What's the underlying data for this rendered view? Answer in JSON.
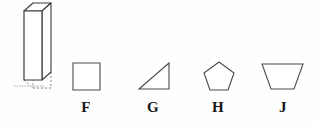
{
  "figure": {
    "background_color": "#fefefe",
    "stroke_color": "#3d3d3d",
    "fill_color": "#ffffff",
    "label_color": "#151515",
    "prism": {
      "name": "rectangular-prism",
      "description": "tall vertical rectangular prism drawn in oblique projection with dashed hidden bottom edge",
      "front_face": "24,11 24,80 42,80 42,11",
      "top_face": "24,11 33,3 51,3 42,11",
      "side_face": "42,11 51,3 51,72 42,80",
      "hidden_edge_vertical": "33,11 33,80",
      "hidden_edge_bottom": "24,80 33,88 51,88 42,80",
      "hidden_dash": "14,86 44,86"
    },
    "choices": [
      {
        "id": "F",
        "label": "F",
        "shape": "square",
        "shape_name": "square-shape-f",
        "points": "73,63 100,63 100,90 73,90"
      },
      {
        "id": "G",
        "label": "G",
        "shape": "right-triangle",
        "shape_name": "triangle-shape-g",
        "points": "169,63 169,89 139,89"
      },
      {
        "id": "H",
        "label": "H",
        "shape": "pentagon",
        "shape_name": "pentagon-shape-h",
        "points": "219,62 234,73 228,90 210,90 204,73"
      },
      {
        "id": "J",
        "label": "J",
        "shape": "trapezoid",
        "shape_name": "trapezoid-shape-j",
        "points": "262,64 303,64 294,89 271,89"
      }
    ]
  }
}
